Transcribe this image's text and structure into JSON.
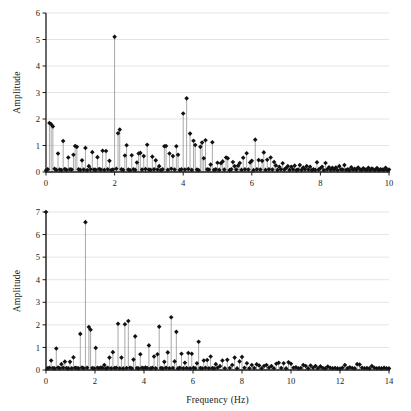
{
  "figure": {
    "name": "fft-amplitude-spectra",
    "background": "#ffffff",
    "marker_color": "#111111",
    "stem_color": "#8c8c8c",
    "grid_color": "#d9d9d9",
    "axis_color": "#1a1a1a"
  },
  "chart_data": [
    {
      "type": "line",
      "id": "top-spectrum",
      "title": "",
      "xlabel": "",
      "ylabel": "Amplitude",
      "xlim": [
        0,
        10
      ],
      "ylim": [
        0,
        6
      ],
      "xticks": [
        0,
        2,
        4,
        6,
        8,
        10
      ],
      "xticklabels": [
        "0",
        "2",
        "4",
        "6",
        "8",
        "10"
      ],
      "yticks": [
        0,
        1,
        2,
        3,
        4,
        5,
        6
      ],
      "yticklabels": [
        "0",
        "1",
        "2",
        "3",
        "4",
        "5",
        "6"
      ],
      "grid": "horizontal",
      "legend": "none",
      "style": "stem",
      "x": [
        0.0,
        0.05,
        0.1,
        0.15,
        0.2,
        0.25,
        0.3,
        0.35,
        0.4,
        0.45,
        0.5,
        0.55,
        0.6,
        0.65,
        0.7,
        0.75,
        0.8,
        0.85,
        0.9,
        0.95,
        1.0,
        1.05,
        1.1,
        1.15,
        1.2,
        1.25,
        1.3,
        1.35,
        1.4,
        1.45,
        1.5,
        1.55,
        1.6,
        1.65,
        1.7,
        1.75,
        1.8,
        1.85,
        1.9,
        1.95,
        2.0,
        2.05,
        2.1,
        2.15,
        2.2,
        2.25,
        2.3,
        2.35,
        2.4,
        2.45,
        2.5,
        2.55,
        2.6,
        2.65,
        2.7,
        2.75,
        2.8,
        2.85,
        2.9,
        2.95,
        3.0,
        3.05,
        3.1,
        3.15,
        3.2,
        3.25,
        3.3,
        3.35,
        3.4,
        3.45,
        3.5,
        3.55,
        3.6,
        3.65,
        3.7,
        3.75,
        3.8,
        3.85,
        3.9,
        3.95,
        4.0,
        4.05,
        4.1,
        4.15,
        4.2,
        4.25,
        4.3,
        4.35,
        4.4,
        4.45,
        4.5,
        4.55,
        4.6,
        4.65,
        4.7,
        4.75,
        4.8,
        4.85,
        4.9,
        4.95,
        5.0,
        5.05,
        5.1,
        5.15,
        5.2,
        5.25,
        5.3,
        5.35,
        5.4,
        5.45,
        5.5,
        5.55,
        5.6,
        5.65,
        5.7,
        5.75,
        5.8,
        5.85,
        5.9,
        5.95,
        6.0,
        6.05,
        6.1,
        6.15,
        6.2,
        6.25,
        6.3,
        6.35,
        6.4,
        6.45,
        6.5,
        6.55,
        6.6,
        6.65,
        6.7,
        6.75,
        6.8,
        6.85,
        6.9,
        6.95,
        7.0,
        7.05,
        7.1,
        7.15,
        7.2,
        7.25,
        7.3,
        7.35,
        7.4,
        7.45,
        7.5,
        7.55,
        7.6,
        7.65,
        7.7,
        7.75,
        7.8,
        7.85,
        7.9,
        7.95,
        8.0,
        8.05,
        8.1,
        8.15,
        8.2,
        8.25,
        8.3,
        8.35,
        8.4,
        8.45,
        8.5,
        8.55,
        8.6,
        8.65,
        8.7,
        8.75,
        8.8,
        8.85,
        8.9,
        8.95,
        9.0,
        9.05,
        9.1,
        9.15,
        9.2,
        9.25,
        9.3,
        9.35,
        9.4,
        9.45,
        9.5,
        9.55,
        9.6,
        9.65,
        9.7,
        9.75,
        9.8,
        9.85,
        9.9,
        9.95,
        10.0
      ],
      "y": [
        0.06,
        0.1,
        1.85,
        1.8,
        1.72,
        0.12,
        0.08,
        0.7,
        0.09,
        0.07,
        1.17,
        0.11,
        0.08,
        0.55,
        0.1,
        0.09,
        0.65,
        0.98,
        0.95,
        0.1,
        0.08,
        0.44,
        0.09,
        0.91,
        0.07,
        0.22,
        0.1,
        0.75,
        0.09,
        0.08,
        0.56,
        0.11,
        0.09,
        0.8,
        0.08,
        0.79,
        0.1,
        0.42,
        0.07,
        0.09,
        5.1,
        0.12,
        1.46,
        1.6,
        0.1,
        0.08,
        0.62,
        1.01,
        0.09,
        0.07,
        0.63,
        0.1,
        0.08,
        0.36,
        0.7,
        0.72,
        0.09,
        0.6,
        0.11,
        1.03,
        0.09,
        0.08,
        0.58,
        0.1,
        0.44,
        0.09,
        0.22,
        0.07,
        0.1,
        0.97,
        0.98,
        0.08,
        0.7,
        0.12,
        0.6,
        0.09,
        0.97,
        0.65,
        0.08,
        0.1,
        2.21,
        0.09,
        2.78,
        0.11,
        1.45,
        0.08,
        1.18,
        1.02,
        0.09,
        0.07,
        0.95,
        1.11,
        0.52,
        1.2,
        0.1,
        0.09,
        0.28,
        1.12,
        0.08,
        0.1,
        0.35,
        0.08,
        0.33,
        0.4,
        0.09,
        0.55,
        0.52,
        0.07,
        0.1,
        0.38,
        0.22,
        0.09,
        0.24,
        0.34,
        0.08,
        0.54,
        0.1,
        0.71,
        0.09,
        0.36,
        0.42,
        0.07,
        1.22,
        0.1,
        0.45,
        0.09,
        0.42,
        0.74,
        0.08,
        0.46,
        0.1,
        0.55,
        0.09,
        0.38,
        0.25,
        0.08,
        0.2,
        0.1,
        0.33,
        0.09,
        0.15,
        0.22,
        0.08,
        0.2,
        0.1,
        0.24,
        0.07,
        0.09,
        0.26,
        0.08,
        0.17,
        0.1,
        0.22,
        0.09,
        0.2,
        0.07,
        0.1,
        0.08,
        0.37,
        0.09,
        0.14,
        0.2,
        0.07,
        0.34,
        0.1,
        0.18,
        0.08,
        0.16,
        0.09,
        0.17,
        0.07,
        0.22,
        0.1,
        0.09,
        0.26,
        0.08,
        0.1,
        0.07,
        0.18,
        0.09,
        0.12,
        0.08,
        0.17,
        0.1,
        0.07,
        0.14,
        0.09,
        0.08,
        0.16,
        0.07,
        0.13,
        0.09,
        0.08,
        0.15,
        0.07,
        0.1,
        0.09,
        0.08,
        0.16,
        0.07,
        0.09
      ]
    },
    {
      "type": "line",
      "id": "bottom-spectrum",
      "title": "",
      "xlabel": "Frequency (Hz)",
      "ylabel": "Amplitude",
      "xlim": [
        0,
        14
      ],
      "ylim": [
        0,
        7
      ],
      "xticks": [
        0,
        2,
        4,
        6,
        8,
        10,
        12,
        14
      ],
      "xticklabels": [
        "0",
        "2",
        "4",
        "6",
        "8",
        "10",
        "12",
        "14"
      ],
      "yticks": [
        0,
        1,
        2,
        3,
        4,
        5,
        6,
        7
      ],
      "yticklabels": [
        "0",
        "1",
        "2",
        "3",
        "4",
        "5",
        "6",
        "7"
      ],
      "grid": "horizontal",
      "legend": "none",
      "style": "stem",
      "x": [
        0.0,
        0.07,
        0.14,
        0.21,
        0.28,
        0.35,
        0.42,
        0.49,
        0.56,
        0.63,
        0.7,
        0.77,
        0.84,
        0.91,
        0.98,
        1.05,
        1.12,
        1.19,
        1.26,
        1.33,
        1.4,
        1.47,
        1.54,
        1.61,
        1.68,
        1.75,
        1.82,
        1.89,
        1.96,
        2.03,
        2.1,
        2.17,
        2.24,
        2.31,
        2.38,
        2.45,
        2.52,
        2.59,
        2.66,
        2.73,
        2.8,
        2.87,
        2.94,
        3.01,
        3.08,
        3.15,
        3.22,
        3.29,
        3.36,
        3.43,
        3.5,
        3.57,
        3.64,
        3.71,
        3.78,
        3.85,
        3.92,
        3.99,
        4.06,
        4.13,
        4.2,
        4.27,
        4.34,
        4.41,
        4.48,
        4.55,
        4.62,
        4.69,
        4.76,
        4.83,
        4.9,
        4.97,
        5.04,
        5.11,
        5.18,
        5.25,
        5.32,
        5.39,
        5.46,
        5.53,
        5.6,
        5.67,
        5.74,
        5.81,
        5.88,
        5.95,
        6.02,
        6.09,
        6.16,
        6.23,
        6.3,
        6.37,
        6.44,
        6.51,
        6.58,
        6.65,
        6.72,
        6.79,
        6.86,
        6.93,
        7.0,
        7.1,
        7.2,
        7.3,
        7.4,
        7.5,
        7.6,
        7.7,
        7.8,
        7.9,
        8.0,
        8.1,
        8.2,
        8.3,
        8.4,
        8.5,
        8.6,
        8.7,
        8.8,
        8.9,
        9.0,
        9.1,
        9.2,
        9.3,
        9.4,
        9.5,
        9.6,
        9.7,
        9.8,
        9.9,
        10.0,
        10.1,
        10.2,
        10.3,
        10.4,
        10.5,
        10.6,
        10.7,
        10.8,
        10.9,
        11.0,
        11.1,
        11.2,
        11.3,
        11.4,
        11.5,
        11.6,
        11.7,
        11.8,
        11.9,
        12.0,
        12.1,
        12.2,
        12.3,
        12.4,
        12.5,
        12.6,
        12.7,
        12.8,
        12.9,
        13.0,
        13.1,
        13.2,
        13.3,
        13.4,
        13.5,
        13.6,
        13.7,
        13.8,
        13.9,
        14.0
      ],
      "y": [
        7.0,
        0.08,
        0.1,
        0.42,
        0.09,
        0.07,
        0.95,
        0.11,
        0.08,
        0.26,
        0.1,
        0.37,
        0.09,
        0.07,
        0.36,
        0.08,
        0.56,
        0.1,
        0.09,
        0.07,
        1.6,
        0.11,
        0.08,
        6.55,
        0.1,
        1.9,
        1.78,
        0.09,
        0.07,
        0.98,
        0.1,
        0.08,
        0.11,
        0.09,
        0.22,
        0.07,
        0.1,
        0.55,
        0.08,
        0.79,
        0.09,
        0.1,
        2.05,
        0.08,
        0.55,
        0.07,
        2.03,
        0.09,
        2.17,
        0.1,
        0.08,
        0.46,
        1.49,
        0.09,
        0.07,
        0.7,
        0.1,
        0.08,
        0.11,
        0.09,
        1.09,
        0.07,
        0.1,
        0.6,
        0.08,
        0.7,
        1.92,
        0.09,
        0.07,
        0.36,
        0.1,
        0.78,
        0.08,
        2.34,
        0.09,
        0.38,
        1.69,
        0.07,
        0.1,
        0.72,
        0.08,
        0.32,
        0.09,
        0.75,
        0.07,
        0.72,
        0.1,
        0.08,
        0.3,
        1.25,
        0.09,
        0.07,
        0.42,
        0.1,
        0.44,
        0.08,
        0.6,
        0.09,
        0.07,
        0.26,
        0.1,
        0.17,
        0.42,
        0.08,
        0.45,
        0.09,
        0.22,
        0.55,
        0.07,
        0.38,
        0.58,
        0.1,
        0.3,
        0.08,
        0.22,
        0.09,
        0.25,
        0.2,
        0.07,
        0.18,
        0.22,
        0.1,
        0.18,
        0.08,
        0.28,
        0.32,
        0.09,
        0.3,
        0.07,
        0.34,
        0.28,
        0.1,
        0.12,
        0.08,
        0.09,
        0.22,
        0.18,
        0.07,
        0.2,
        0.1,
        0.18,
        0.08,
        0.16,
        0.09,
        0.07,
        0.15,
        0.1,
        0.08,
        0.09,
        0.07,
        0.06,
        0.1,
        0.22,
        0.08,
        0.12,
        0.09,
        0.07,
        0.26,
        0.24,
        0.1,
        0.08,
        0.09,
        0.07,
        0.18,
        0.1,
        0.08,
        0.09,
        0.07,
        0.1,
        0.08,
        0.07
      ]
    }
  ]
}
